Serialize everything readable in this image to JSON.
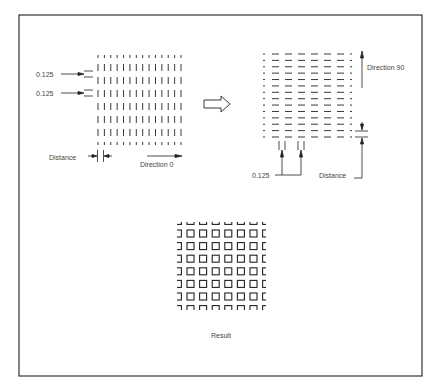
{
  "colors": {
    "frame": "#333333",
    "line": "#222222",
    "text": "#444444",
    "background": "#ffffff"
  },
  "panel_left": {
    "grid": {
      "columns": 14,
      "full_rows": 6,
      "orientation": "vertical-dashes"
    },
    "labels": {
      "spacing_1": "0.125",
      "spacing_2": "0.125",
      "distance": "Distance",
      "direction": "Direction 0"
    }
  },
  "transition_arrow": "right-hollow-arrow",
  "panel_right": {
    "grid": {
      "rows": 14,
      "full_columns": 6,
      "orientation": "horizontal-dashes"
    },
    "labels": {
      "direction": "Direction 90",
      "spacing": "0.125",
      "distance": "Distance"
    }
  },
  "panel_result": {
    "grid": {
      "full_rows": 6,
      "full_columns": 6,
      "cell": "square"
    },
    "label": "Result"
  }
}
